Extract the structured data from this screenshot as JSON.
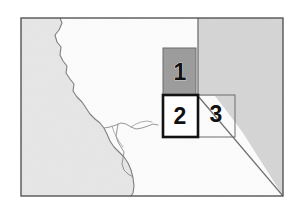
{
  "figure": {
    "name": "regional-location-map",
    "background_color": "#ffffff",
    "paper_tint": "#fbfbfb"
  },
  "frame": {
    "name": "map-border",
    "x": 21,
    "y": 18,
    "width": 262,
    "height": 178,
    "stroke_color": "#555555",
    "stroke_width": 1.4,
    "fill_color": "#fcfcfc"
  },
  "regions": [
    {
      "name": "ocean-region",
      "label": "",
      "fill_color": "#e6e6e6",
      "stroke_color": "#8d8d8d",
      "position": "left"
    },
    {
      "name": "land-region",
      "label": "",
      "fill_color": "#fcfcfc",
      "stroke_color": "#8d8d8d",
      "position": "center"
    },
    {
      "name": "adjacent-state-region",
      "label": "",
      "fill_color": "#d5d5d5",
      "stroke_color": "#8a8a8a",
      "position": "upper-right"
    }
  ],
  "boundaries": [
    {
      "name": "coastline",
      "stroke_color": "#7e7e7e",
      "stroke_width": 1.1
    },
    {
      "name": "bay-shoreline",
      "stroke_color": "#8a8a8a",
      "stroke_width": 0.9
    },
    {
      "name": "state-boundary-diagonal",
      "stroke_color": "#6f6f6f",
      "stroke_width": 1.3
    },
    {
      "name": "state-boundary-vertical",
      "stroke_color": "#6f6f6f",
      "stroke_width": 1.3
    }
  ],
  "study_boxes": [
    {
      "id": 1,
      "label": "1",
      "name": "study-box-1",
      "x": 163,
      "y": 48,
      "width": 33,
      "height": 48,
      "fill_color": "#9c9c9c",
      "fill_opacity": 1,
      "stroke_color": "#6a6a6a",
      "stroke_width": 1,
      "label_x": 180,
      "label_y": 74,
      "label_color": "#111111"
    },
    {
      "id": 2,
      "label": "2",
      "name": "study-box-2",
      "x": 163,
      "y": 95,
      "width": 35,
      "height": 42,
      "fill_color": "#ffffff",
      "fill_opacity": 1,
      "stroke_color": "#121212",
      "stroke_width": 2.6,
      "label_x": 180,
      "label_y": 118,
      "label_color": "#111111"
    },
    {
      "id": 3,
      "label": "3",
      "name": "study-box-3",
      "x": 196,
      "y": 95,
      "width": 39,
      "height": 42,
      "fill_color": "none",
      "fill_opacity": 0,
      "stroke_color": "#6d6d6d",
      "stroke_width": 1,
      "label_x": 216,
      "label_y": 116,
      "label_color": "#111111"
    }
  ],
  "colors": {
    "ocean": "#e6e6e6",
    "state_shade": "#d5d5d5",
    "box1_fill": "#9c9c9c",
    "box2_stroke": "#121212",
    "frame_stroke": "#555555",
    "label_text": "#111111"
  }
}
